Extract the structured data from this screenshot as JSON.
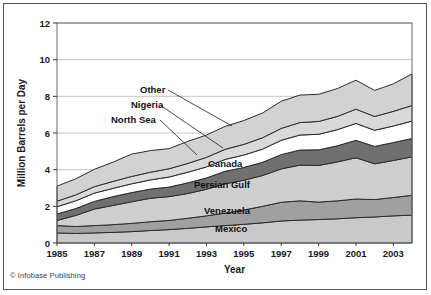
{
  "figure": {
    "credit": "© Infobase Publishing"
  },
  "chart_data": {
    "type": "area",
    "stacked": true,
    "title": "",
    "xlabel": "Year",
    "ylabel": "Million Barrels per Day",
    "xlim": [
      1985,
      2004
    ],
    "ylim": [
      0,
      12
    ],
    "ytick_values": [
      0,
      2,
      4,
      6,
      8,
      10,
      12
    ],
    "ytick_labels": [
      "0",
      "2",
      "4",
      "6",
      "8",
      "10",
      "12"
    ],
    "xtick_values": [
      1985,
      1987,
      1989,
      1991,
      1993,
      1995,
      1997,
      1999,
      2001,
      2003
    ],
    "xtick_labels": [
      "1985",
      "1987",
      "1989",
      "1991",
      "1993",
      "1995",
      "1997",
      "1999",
      "2001",
      "2003"
    ],
    "grid": true,
    "grid_axis": "y",
    "legend_position": "inline-labels",
    "x": [
      1985,
      1986,
      1987,
      1988,
      1989,
      1990,
      1991,
      1992,
      1993,
      1994,
      1995,
      1996,
      1997,
      1998,
      1999,
      2000,
      2001,
      2002,
      2003,
      2004
    ],
    "series": [
      {
        "name": "Mexico",
        "color": "#c9c9c9",
        "label": "Mexico",
        "values": [
          0.55,
          0.52,
          0.55,
          0.58,
          0.62,
          0.68,
          0.73,
          0.8,
          0.88,
          0.95,
          1.02,
          1.1,
          1.2,
          1.25,
          1.28,
          1.32,
          1.38,
          1.42,
          1.48,
          1.52
        ]
      },
      {
        "name": "Venezuela",
        "color": "#a0a0a0",
        "label": "Venezuela",
        "values": [
          0.4,
          0.38,
          0.4,
          0.42,
          0.45,
          0.48,
          0.5,
          0.55,
          0.6,
          0.68,
          0.78,
          0.9,
          1.02,
          1.05,
          0.95,
          0.98,
          1.02,
          0.95,
          1.0,
          1.08
        ]
      },
      {
        "name": "Persian Gulf",
        "color": "#cfcfcf",
        "label": "Persian Gulf",
        "values": [
          0.28,
          0.6,
          0.9,
          1.05,
          1.18,
          1.28,
          1.3,
          1.35,
          1.45,
          1.6,
          1.62,
          1.68,
          1.82,
          1.95,
          2.0,
          2.12,
          2.25,
          1.95,
          2.02,
          2.1
        ]
      },
      {
        "name": "Canada",
        "color": "#707070",
        "label": "Canada",
        "values": [
          0.35,
          0.38,
          0.42,
          0.48,
          0.5,
          0.5,
          0.52,
          0.58,
          0.62,
          0.68,
          0.7,
          0.72,
          0.78,
          0.82,
          0.85,
          0.88,
          0.95,
          0.95,
          0.98,
          1.0
        ]
      },
      {
        "name": "North Sea",
        "color": "#ffffff",
        "label": "North Sea",
        "values": [
          0.4,
          0.42,
          0.45,
          0.45,
          0.48,
          0.5,
          0.55,
          0.58,
          0.6,
          0.65,
          0.68,
          0.72,
          0.78,
          0.82,
          0.85,
          0.88,
          0.92,
          0.88,
          0.9,
          0.95
        ]
      },
      {
        "name": "Nigeria",
        "color": "#d9d9d9",
        "label": "Nigeria",
        "values": [
          0.3,
          0.32,
          0.35,
          0.38,
          0.4,
          0.42,
          0.45,
          0.48,
          0.52,
          0.55,
          0.58,
          0.62,
          0.65,
          0.68,
          0.7,
          0.72,
          0.78,
          0.75,
          0.8,
          0.85
        ]
      },
      {
        "name": "Other",
        "color": "#d2d2d2",
        "label": "Other",
        "values": [
          0.82,
          0.88,
          0.95,
          1.05,
          1.22,
          1.18,
          1.1,
          1.2,
          1.22,
          1.25,
          1.3,
          1.35,
          1.48,
          1.5,
          1.48,
          1.52,
          1.58,
          1.42,
          1.5,
          1.72
        ]
      }
    ],
    "annotations": [
      {
        "text": "Other",
        "x": 140,
        "y": 93
      },
      {
        "text": "Nigeria",
        "x": 131,
        "y": 108
      },
      {
        "text": "North Sea",
        "x": 111,
        "y": 123
      },
      {
        "text": "Canada",
        "x": 208,
        "y": 167
      },
      {
        "text": "Persian Gulf",
        "x": 194,
        "y": 188
      },
      {
        "text": "Venezuela",
        "x": 204,
        "y": 214
      },
      {
        "text": "Mexico",
        "x": 215,
        "y": 232
      }
    ]
  }
}
